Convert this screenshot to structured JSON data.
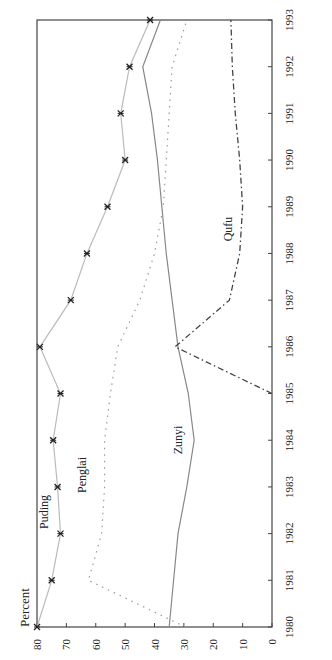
{
  "chart_data": {
    "type": "line",
    "orientation": "rotated-90-ccw",
    "title": "",
    "xlabel": "",
    "ylabel": "Percent",
    "ylim": [
      0,
      80
    ],
    "yticks": [
      0,
      10,
      20,
      30,
      40,
      50,
      60,
      70,
      80
    ],
    "x": [
      1980,
      1981,
      1982,
      1983,
      1984,
      1985,
      1986,
      1987,
      1988,
      1989,
      1990,
      1991,
      1992,
      1993
    ],
    "grid": false,
    "legend": "inline labels",
    "series": [
      {
        "name": "Puding",
        "style": "light solid with x markers",
        "color": "#bbbbbb",
        "values": [
          80,
          75,
          72,
          73,
          74.5,
          72,
          79,
          68.5,
          63,
          56,
          50,
          51.5,
          48.5,
          41.5
        ]
      },
      {
        "name": "Zunyi",
        "style": "solid",
        "color": "#888888",
        "values": [
          35,
          33.5,
          32,
          29,
          26.5,
          28.5,
          32,
          34,
          36,
          37.5,
          39,
          41,
          44,
          38
        ]
      },
      {
        "name": "Penglai",
        "style": "dotted",
        "color": "#999999",
        "values": [
          29.5,
          62.5,
          58,
          57,
          57,
          55,
          52.5,
          45,
          40,
          37,
          36,
          35,
          34,
          29
        ]
      },
      {
        "name": "Qufu",
        "style": "dash-dot",
        "color": "#444444",
        "values": [
          null,
          null,
          null,
          null,
          null,
          0,
          33,
          14.5,
          11,
          10,
          11,
          12.5,
          13.5,
          14
        ]
      }
    ],
    "labels": {
      "Puding": "Puding",
      "Zunyi": "Zunyi",
      "Penglai": "Penglai",
      "Qufu": "Qufu"
    }
  }
}
